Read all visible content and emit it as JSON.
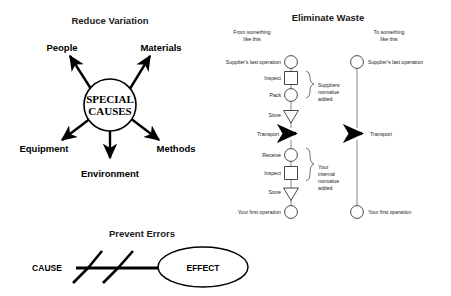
{
  "page": {
    "background": "#ffffff",
    "ink": "#1a1a1a",
    "width": 451,
    "height": 296
  },
  "reduce_variation": {
    "title": "Reduce Variation",
    "hub_line1": "SPECIAL",
    "hub_line2": "CAUSES",
    "spokes": [
      {
        "label": "People"
      },
      {
        "label": "Materials"
      },
      {
        "label": "Equipment"
      },
      {
        "label": "Methods"
      },
      {
        "label": "Environment"
      }
    ]
  },
  "eliminate_waste": {
    "title": "Eliminate Waste",
    "left_heading_line1": "From something",
    "left_heading_line2": "like this",
    "right_heading_line1": "To something",
    "right_heading_line2": "like this",
    "left_steps": [
      {
        "label": "Supplier's last operation",
        "shape": "circle"
      },
      {
        "label": "Inspect",
        "shape": "square"
      },
      {
        "label": "Pack",
        "shape": "circle"
      },
      {
        "label": "Store",
        "shape": "triangle"
      },
      {
        "label": "Transport",
        "shape": "arrow"
      },
      {
        "label": "Receive",
        "shape": "circle"
      },
      {
        "label": "Inspect",
        "shape": "square"
      },
      {
        "label": "Store",
        "shape": "triangle"
      },
      {
        "label": "Your first operation",
        "shape": "circle"
      }
    ],
    "right_steps": [
      {
        "label": "Supplier's last operation",
        "shape": "circle"
      },
      {
        "label": "Transport",
        "shape": "arrow"
      },
      {
        "label": "Your first operation",
        "shape": "circle"
      }
    ],
    "brace_supplier": {
      "line1": "Suppliers",
      "line2": "nonvalue",
      "line3": "added"
    },
    "brace_internal": {
      "line1": "Your",
      "line2": "internal",
      "line3": "nonvalue",
      "line4": "added"
    }
  },
  "prevent_errors": {
    "title": "Prevent Errors",
    "cause_label": "CAUSE",
    "effect_label": "EFFECT"
  }
}
